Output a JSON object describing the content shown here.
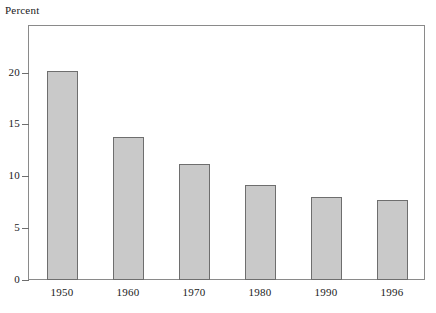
{
  "chart_data": {
    "type": "bar",
    "title": "",
    "subtitle": "",
    "xlabel": "",
    "ylabel": "Percent",
    "categories": [
      "1950",
      "1960",
      "1970",
      "1980",
      "1990",
      "1996"
    ],
    "values": [
      20.2,
      13.8,
      11.2,
      9.2,
      8.0,
      7.7
    ],
    "series": [
      {
        "name": "Percent",
        "values": [
          20.2,
          13.8,
          11.2,
          9.2,
          8.0,
          7.7
        ]
      }
    ],
    "ylim": [
      0,
      24.5
    ],
    "xlim": [
      0,
      6
    ],
    "y_ticks": [
      0,
      5,
      10,
      15,
      20
    ],
    "y_tick_labels": [
      "0",
      "5",
      "10",
      "15",
      "20"
    ],
    "x_tick_labels": [
      "1950",
      "1960",
      "1970",
      "1980",
      "1990",
      "1996"
    ],
    "grid": false,
    "legend": false,
    "legend_position": "none",
    "bar_color": "#c9c9c9",
    "bar_border_color": "#6e6e6e",
    "frame_color": "#8a8a8a",
    "text_color": "#1a1a1a",
    "annotations": []
  },
  "axis": {
    "y_title": "Percent"
  }
}
